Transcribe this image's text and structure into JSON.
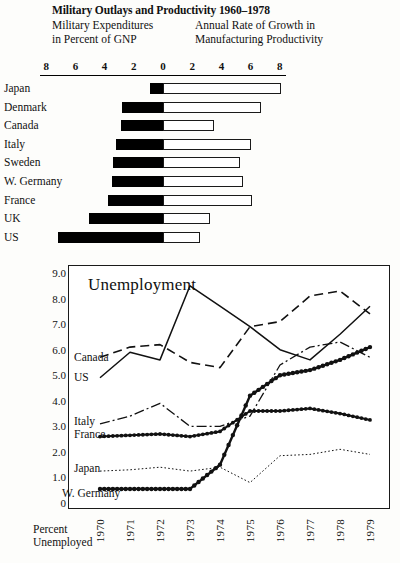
{
  "header": {
    "main_title": "Military Outlays and Productivity 1960–1978",
    "subtitle_left_line1": "Military Expenditures",
    "subtitle_left_line2": "in Percent of GNP",
    "subtitle_right_line1": "Annual Rate of Growth in",
    "subtitle_right_line2": "Manufacturing Productivity"
  },
  "bar_chart_data": {
    "type": "bar",
    "title": "Military Outlays and Productivity 1960–1978",
    "orientation": "horizontal-diverging",
    "axis_ticks": [
      8,
      6,
      4,
      2,
      0,
      2,
      4,
      6,
      8
    ],
    "axis_min": 0,
    "axis_max": 8,
    "left_series": "Military Expenditures in Percent of GNP",
    "right_series": "Annual Rate of Growth in Manufacturing Productivity",
    "categories": [
      "Japan",
      "Denmark",
      "Canada",
      "Italy",
      "Sweden",
      "W. Germany",
      "France",
      "UK",
      "US"
    ],
    "military_percent_gnp": [
      0.9,
      2.8,
      2.9,
      3.2,
      3.4,
      3.5,
      3.8,
      5.1,
      7.2
    ],
    "productivity_growth": [
      8.1,
      6.7,
      3.5,
      6.0,
      5.3,
      5.5,
      6.1,
      3.2,
      2.5
    ],
    "tick_labels": {
      "t_neg8": "8",
      "t_neg6": "6",
      "t_neg4": "4",
      "t_neg2": "2",
      "t_zero": "0",
      "t_pos2": "2",
      "t_pos4": "4",
      "t_pos6": "6",
      "t_pos8": "8"
    }
  },
  "chart_data": {
    "type": "line",
    "title": "Unemployment",
    "xlabel": "Percent Unemployed",
    "ylabel": "",
    "x": [
      1970,
      1971,
      1972,
      1973,
      1974,
      1975,
      1976,
      1977,
      1978,
      1979
    ],
    "x_tick_labels": [
      "1970",
      "1971",
      "1972",
      "1973",
      "1974",
      "1975",
      "1976",
      "1977",
      "1978",
      "1979"
    ],
    "y_tick_labels": [
      "9.0",
      "8.0",
      "7.0",
      "6.0",
      "5.0",
      "4.0",
      "3.0",
      "2.0",
      "1.0",
      "0"
    ],
    "y_ticks": [
      9.0,
      8.0,
      7.0,
      6.0,
      5.0,
      4.0,
      3.0,
      2.0,
      1.0,
      0
    ],
    "ylim": [
      0,
      9
    ],
    "grid": false,
    "legend_position": "inline-left",
    "series": [
      {
        "name": "Canada",
        "style": "dashed",
        "values": [
          5.7,
          6.1,
          6.2,
          5.5,
          5.3,
          6.9,
          7.1,
          8.1,
          8.3,
          7.4
        ]
      },
      {
        "name": "US",
        "style": "solid",
        "values": [
          4.9,
          5.9,
          5.6,
          8.5,
          7.7,
          6.9,
          6.0,
          5.6,
          6.6,
          7.7
        ]
      },
      {
        "name": "Italy",
        "style": "dash-dot",
        "values": [
          3.1,
          3.4,
          3.9,
          3.0,
          3.0,
          3.4,
          5.4,
          6.1,
          6.3,
          5.7
        ]
      },
      {
        "name": "France",
        "style": "dotted-bead",
        "values": [
          2.6,
          2.65,
          2.7,
          2.6,
          2.8,
          3.6,
          3.6,
          3.7,
          3.5,
          3.25
        ]
      },
      {
        "name": "Japan",
        "style": "fine-dotted",
        "values": [
          1.25,
          1.3,
          1.4,
          1.25,
          1.4,
          0.8,
          1.85,
          1.9,
          2.1,
          1.9
        ]
      },
      {
        "name": "W. Germany",
        "style": "thick-bead",
        "values": [
          0.55,
          0.55,
          0.55,
          0.55,
          1.5,
          4.2,
          5.0,
          5.2,
          5.6,
          6.1
        ]
      }
    ]
  },
  "line_chart_labels": {
    "plot_title": "Unemployment",
    "canada": "Canada",
    "us": "US",
    "italy": "Italy",
    "france": "France",
    "japan": "Japan",
    "w_germany": "W. Germany",
    "x_caption_line1": "Percent",
    "x_caption_line2": "Unemployed"
  },
  "colors": {
    "ink": "#111111",
    "paper": "#fdfdfb",
    "bar_fill_black": "#000000",
    "bar_fill_white": "#ffffff"
  }
}
